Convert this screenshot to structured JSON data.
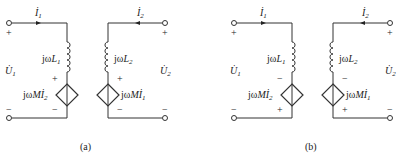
{
  "diagrams": [
    {
      "id": "a",
      "caption": "(a)",
      "port1": {
        "current_label": "İ",
        "current_sub": "1",
        "voltage_label": "U̇",
        "voltage_sub": "1",
        "plus": "+",
        "minus": "−"
      },
      "port2": {
        "current_label": "İ",
        "current_sub": "2",
        "voltage_label": "U̇",
        "voltage_sub": "2",
        "plus": "+",
        "minus": "−"
      },
      "left_branch": {
        "inductor_prefix": "jω",
        "inductor_var": "L",
        "inductor_sub": "1",
        "source_prefix": "jω",
        "source_var": "Mİ",
        "source_sub": "2",
        "source_top_sign": "+",
        "source_bottom_sign": "−"
      },
      "right_branch": {
        "inductor_prefix": "jω",
        "inductor_var": "L",
        "inductor_sub": "2",
        "source_prefix": "jω",
        "source_var": "Mİ",
        "source_sub": "1",
        "source_top_sign": "+",
        "source_bottom_sign": "−"
      }
    },
    {
      "id": "b",
      "caption": "(b)",
      "port1": {
        "current_label": "İ",
        "current_sub": "1",
        "voltage_label": "U̇",
        "voltage_sub": "1",
        "plus": "+",
        "minus": "−"
      },
      "port2": {
        "current_label": "İ",
        "current_sub": "2",
        "voltage_label": "U̇",
        "voltage_sub": "2",
        "plus": "+",
        "minus": "−"
      },
      "left_branch": {
        "inductor_prefix": "jω",
        "inductor_var": "L",
        "inductor_sub": "1",
        "source_prefix": "jω",
        "source_var": "Mİ",
        "source_sub": "2",
        "source_top_sign": "−",
        "source_bottom_sign": "+"
      },
      "right_branch": {
        "inductor_prefix": "jω",
        "inductor_var": "L",
        "inductor_sub": "2",
        "source_prefix": "jω",
        "source_var": "Mİ",
        "source_sub": "1",
        "source_top_sign": "−",
        "source_bottom_sign": "+"
      }
    }
  ],
  "colors": {
    "line": "#333333",
    "background": "#ffffff"
  }
}
